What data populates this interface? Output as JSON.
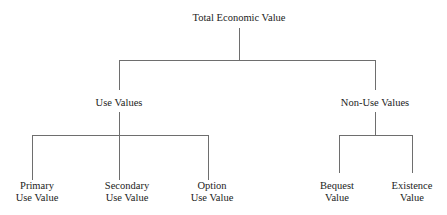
{
  "diagram": {
    "type": "tree",
    "root": {
      "label": "Total Economic Value"
    },
    "level1": [
      {
        "label": "Use Values"
      },
      {
        "label": "Non-Use Values"
      }
    ],
    "use_values_children": [
      {
        "line1": "Primary",
        "line2": "Use Value"
      },
      {
        "line1": "Secondary",
        "line2": "Use Value"
      },
      {
        "line1": "Option",
        "line2": "Use Value"
      }
    ],
    "non_use_values_children": [
      {
        "line1": "Bequest",
        "line2": "Value"
      },
      {
        "line1": "Existence",
        "line2": "Value"
      }
    ],
    "colors": {
      "line": "#6e6e6e",
      "text": "#222222",
      "background": "#ffffff"
    }
  }
}
